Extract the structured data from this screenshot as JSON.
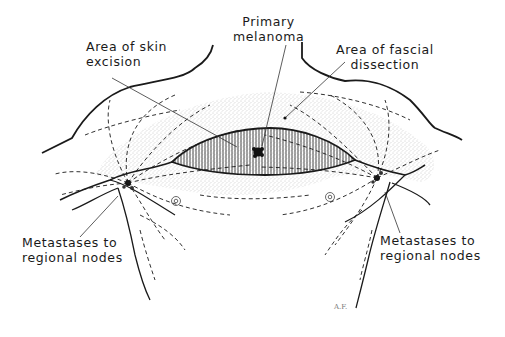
{
  "figure": {
    "labels": {
      "primary_melanoma": {
        "line1": "Primary",
        "line2": "melanoma"
      },
      "skin_excision": {
        "line1": "Area of skin",
        "line2": "excision"
      },
      "fascial_dissection": {
        "line1": "Area of fascial",
        "line2": "dissection"
      },
      "metastases_left": {
        "line1": "Metastases to",
        "line2": "regional nodes"
      },
      "metastases_right": {
        "line1": "Metastases to",
        "line2": "regional nodes"
      }
    },
    "signature": "A.F.",
    "colors": {
      "ink": "#1a1a1a",
      "stipple": "#9a9a9a",
      "background": "#ffffff"
    }
  }
}
